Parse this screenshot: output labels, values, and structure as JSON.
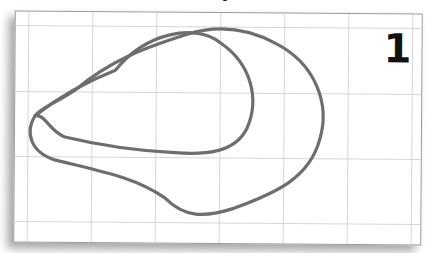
{
  "card": {
    "label": "1",
    "grid": {
      "columns": 6,
      "rows": 3,
      "line_color": "#d4d4d4"
    },
    "curves": [
      {
        "name": "inner-loop",
        "stroke": "#6e6e6e"
      },
      {
        "name": "outer-loop",
        "stroke": "#6e6e6e"
      }
    ]
  }
}
